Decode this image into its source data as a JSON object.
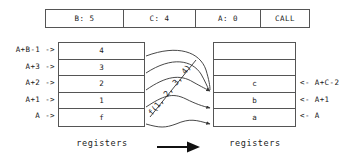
{
  "call_bar": {
    "cells": [
      {
        "label": "B: 5"
      },
      {
        "label": "C: 4"
      },
      {
        "label": "A: 0"
      },
      {
        "label": "CALL"
      }
    ]
  },
  "registers_before": {
    "caption": "registers",
    "rows": [
      {
        "address": "A+B-1 ->",
        "value": "4"
      },
      {
        "address": "A+3 ->",
        "value": "3"
      },
      {
        "address": "A+2 ->",
        "value": "2"
      },
      {
        "address": "A+1 ->",
        "value": "1"
      },
      {
        "address": "A ->",
        "value": "f"
      }
    ]
  },
  "registers_after": {
    "caption": "registers",
    "rows": [
      {
        "address": "",
        "value": ""
      },
      {
        "address": "",
        "value": ""
      },
      {
        "address": "<- A+C-2",
        "value": "c"
      },
      {
        "address": "<- A+1",
        "value": "b"
      },
      {
        "address": "<- A",
        "value": "a"
      }
    ]
  },
  "transform": {
    "call_label": "f(1, 2, 3, 4)",
    "arrow_icon": "right-arrow-icon"
  },
  "colors": {
    "stroke": "#555555",
    "text": "#1a1a1a",
    "background": "#ffffff"
  }
}
